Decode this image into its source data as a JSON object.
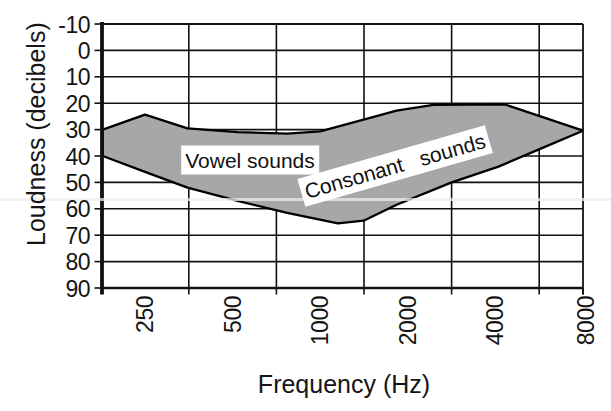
{
  "chart_data": {
    "type": "area",
    "title": "",
    "xlabel": "Frequency (Hz)",
    "ylabel": "Loudness (decibels)",
    "x_scale": "octaves (log2); vertical gridlines fall midway between octave ticks, category-style",
    "x_tick_labels": [
      "250",
      "500",
      "1000",
      "2000",
      "4000",
      "8000"
    ],
    "x_tick_freqs": [
      250,
      500,
      1000,
      2000,
      4000,
      8000
    ],
    "y_tick_labels": [
      "-10",
      "0",
      "10",
      "20",
      "30",
      "40",
      "50",
      "60",
      "70",
      "80",
      "90"
    ],
    "y_tick_values": [
      -10,
      0,
      10,
      20,
      30,
      40,
      50,
      60,
      70,
      80,
      90
    ],
    "ylim": [
      -10,
      90
    ],
    "y_axis_direction": "inverted (decibels increase downward, audiogram convention)",
    "grid": true,
    "legend": "none",
    "region": {
      "name": "speech-sounds-area",
      "fill": "#a7a7a7",
      "stroke": "#000000",
      "upper_contour_freq_db": [
        [
          179,
          30
        ],
        [
          250,
          24.3
        ],
        [
          350,
          29.5
        ],
        [
          520,
          31
        ],
        [
          770,
          31.5
        ],
        [
          1000,
          30.7
        ],
        [
          1410,
          26.2
        ],
        [
          1830,
          22.8
        ],
        [
          2450,
          20.6
        ],
        [
          4300,
          20.4
        ],
        [
          8000,
          30.4
        ]
      ],
      "lower_contour_freq_db": [
        [
          179,
          40
        ],
        [
          250,
          46
        ],
        [
          350,
          52
        ],
        [
          520,
          57
        ],
        [
          770,
          61.5
        ],
        [
          1150,
          65.5
        ],
        [
          1410,
          64.5
        ],
        [
          1830,
          58.5
        ],
        [
          2830,
          50
        ],
        [
          4100,
          44
        ],
        [
          5650,
          37.5
        ],
        [
          8000,
          30.4
        ]
      ]
    },
    "annotations": [
      {
        "text": "Vowel sounds",
        "center_x_px": 250,
        "center_y_px": 160,
        "rotation_deg": 0,
        "bg": "#ffffff",
        "color": "#111111"
      },
      {
        "text": "Consonant   sounds",
        "center_x_px": 395,
        "center_y_px": 166,
        "rotation_deg": -16,
        "bg": "#ffffff",
        "color": "#111111"
      }
    ],
    "colors": {
      "axis": "#111111",
      "grid": "#111111",
      "background": "#ffffff",
      "text": "#151515"
    }
  }
}
